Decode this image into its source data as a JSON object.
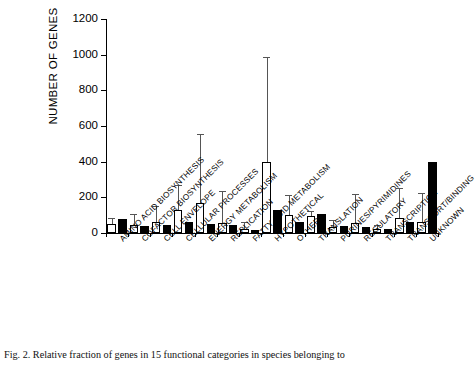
{
  "figure": {
    "caption": "Fig. 2. Relative fraction of genes in 15 functional categories in species belonging to",
    "caption_fragment": ""
  },
  "chart_data": {
    "type": "bar",
    "title": "",
    "xlabel": "",
    "ylabel": "NUMBER OF GENES",
    "ylim": [
      0,
      1200
    ],
    "yticks": [
      0,
      200,
      400,
      600,
      800,
      1000,
      1200
    ],
    "grid": false,
    "legend": false,
    "categories": [
      "AMINO ACID BIOSYNTHESIS",
      "COFACTOR BIOSYNTHESIS",
      "CELL ENVELOPE",
      "CELLULAR PROCESSES",
      "ENERGY METABOLISM",
      "REPLICATION",
      "FATTY ACID METABOLISM",
      "HYPOTHETICAL",
      "OTHER",
      "TRANSLATION",
      "PURINES/PYRIMIDINES",
      "REGULATORY",
      "TRANSCRIPTION",
      "TRANSPORT/BINDING",
      "UNKNOWN"
    ],
    "series": [
      {
        "name": "open",
        "fill": "#ffffff",
        "values": [
          50,
          45,
          62,
          130,
          170,
          55,
          25,
          400,
          100,
          95,
          35,
          55,
          25,
          85,
          60
        ],
        "errors": [
          30,
          55,
          85,
          135,
          380,
          175,
          30,
          580,
          105,
          25,
          35,
          160,
          12,
          160,
          160
        ]
      },
      {
        "name": "solid",
        "fill": "#000000",
        "values": [
          80,
          40,
          45,
          60,
          50,
          45,
          18,
          130,
          60,
          105,
          40,
          35,
          20,
          60,
          400
        ],
        "errors": [
          0,
          0,
          0,
          0,
          0,
          0,
          0,
          0,
          0,
          0,
          0,
          0,
          0,
          0,
          0
        ]
      }
    ]
  }
}
